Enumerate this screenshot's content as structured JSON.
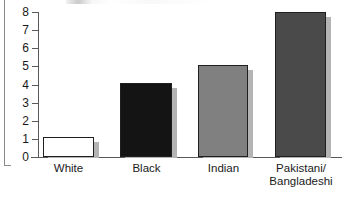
{
  "chart_data": {
    "type": "bar",
    "title": "",
    "xlabel": "",
    "ylabel": "",
    "categories": [
      "White",
      "Black",
      "Indian",
      "Pakistani/ Bangladeshi"
    ],
    "values": [
      1.1,
      4.1,
      5.1,
      8.0
    ],
    "ylim": [
      0,
      8
    ],
    "yticks": [
      0,
      1,
      2,
      3,
      4,
      5,
      6,
      7,
      8
    ],
    "ytick_labels": [
      "0",
      "1",
      "2",
      "3",
      "4",
      "5",
      "6",
      "7",
      "8"
    ],
    "grid": false,
    "legend": "none",
    "series": [
      {
        "name": "",
        "values": [
          1.1,
          4.1,
          5.1,
          8.0
        ]
      }
    ],
    "bar_colors": [
      "#ffffff",
      "#141414",
      "#808080",
      "#4a4a4a"
    ],
    "bar_edge_color": "#1f1f1f",
    "axis_color": "#5a5a5a"
  },
  "axis": {
    "ticks": [
      {
        "label": "8",
        "value": 8
      },
      {
        "label": "7",
        "value": 7
      },
      {
        "label": "6",
        "value": 6
      },
      {
        "label": "5",
        "value": 5
      },
      {
        "label": "4",
        "value": 4
      },
      {
        "label": "3",
        "value": 3
      },
      {
        "label": "2",
        "value": 2
      },
      {
        "label": "1",
        "value": 1
      },
      {
        "label": "0",
        "value": 0
      }
    ]
  },
  "categories": [
    {
      "line1": "White",
      "line2": ""
    },
    {
      "line1": "Black",
      "line2": ""
    },
    {
      "line1": "Indian",
      "line2": ""
    },
    {
      "line1": "Pakistani/",
      "line2": "Bangladeshi"
    }
  ]
}
